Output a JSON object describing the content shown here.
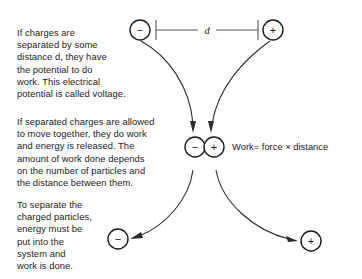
{
  "diagram": {
    "background_color": "#ffffff",
    "ink_color": "#1a1a1a",
    "paragraphs": {
      "voltage": "If charges are\nseparated by some\ndistance d, they have\nthe potential to do\nwork. This electrical\npotential is called voltage.",
      "release": "If separated charges are allowed\nto move together, they do work\nand energy is released. The\namount of work done depends\non the number of particles and\nthe distance between them.",
      "separate": "To separate the\ncharged particles,\nenergy must be\nput into the\nsystem and\nwork is done."
    },
    "equation": "Work= force × distance",
    "distance_label": "d",
    "charges": {
      "negative_symbol": "−",
      "positive_symbol": "+",
      "top_left_label": "−",
      "top_right_label": "+",
      "middle_left_label": "−",
      "middle_right_label": "+",
      "bottom_left_label": "−",
      "bottom_right_label": "+"
    }
  }
}
